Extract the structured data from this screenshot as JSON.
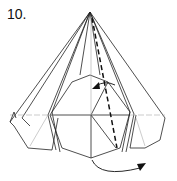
{
  "diagram": {
    "step_label": "10."
  }
}
